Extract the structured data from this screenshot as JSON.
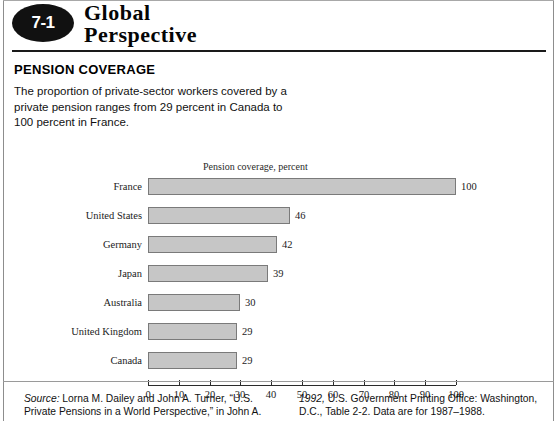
{
  "badge": {
    "number": "7-1"
  },
  "banner": {
    "line1": "Global",
    "line2": "Perspective"
  },
  "headline": "PENSION COVERAGE",
  "intro": "The proportion of private-sector workers covered by a private pension ranges from 29 percent in Canada to 100 percent in France.",
  "footer": {
    "left_italic": "Source:",
    "left_text": " Lorna M. Dailey and John A. Turner, “U.S. Private Pensions in a World Perspective,” in John A.",
    "right_italic": "1992,",
    "right_text": " U.S. Government Printing Office: Washington, D.C., Table 2-2. Data are for 1987–1988."
  },
  "chart_data": {
    "type": "bar",
    "orientation": "horizontal",
    "title": "Pension coverage, percent",
    "xlabel": "",
    "ylabel": "",
    "categories": [
      "France",
      "United States",
      "Germany",
      "Japan",
      "Australia",
      "United Kingdom",
      "Canada"
    ],
    "values": [
      100,
      46,
      42,
      39,
      30,
      29,
      29
    ],
    "value_labels": [
      "100",
      "46",
      "42",
      "39",
      "30",
      "29",
      "29"
    ],
    "xlim": [
      0,
      100
    ],
    "xticks": [
      0,
      10,
      20,
      30,
      40,
      50,
      60,
      70,
      80,
      90,
      100
    ],
    "xtick_labels": [
      "0",
      "10",
      "20",
      "30",
      "40",
      "50",
      "60",
      "70",
      "80",
      "90",
      "100"
    ],
    "grid": false,
    "legend": false,
    "bar_fill": "#c6c6c6",
    "bar_edge": "#7a7a7a"
  }
}
